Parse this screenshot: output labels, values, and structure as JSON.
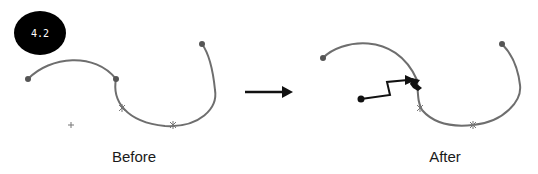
{
  "badge": {
    "label": "4.2",
    "bg": "#000000",
    "fg": "#ffffff"
  },
  "panels": [
    {
      "caption": "Before"
    },
    {
      "caption": "After"
    }
  ],
  "colors": {
    "curve": "#6e6e6e",
    "path": "#111111",
    "arrow": "#111111"
  },
  "icons": [
    "control-point-icon",
    "star-marker-icon",
    "plus-cursor-icon",
    "right-arrow-icon",
    "drag-path-icon"
  ]
}
